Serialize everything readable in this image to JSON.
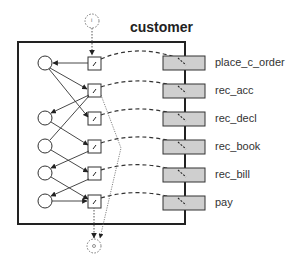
{
  "diagram": {
    "title": "customer",
    "input_place_label": "i",
    "output_place_label": "o",
    "ports": [
      {
        "label": "place_c_order"
      },
      {
        "label": "rec_acc"
      },
      {
        "label": "rec_decl"
      },
      {
        "label": "rec_book"
      },
      {
        "label": "rec_bill"
      },
      {
        "label": "pay"
      }
    ],
    "colors": {
      "frame": "#222222",
      "port_fill": "#cfcfcf",
      "line": "#333333"
    }
  }
}
